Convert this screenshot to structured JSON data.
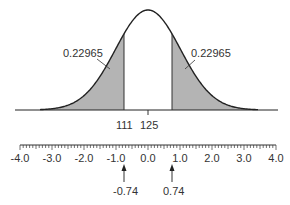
{
  "diagram": {
    "type": "normal-distribution",
    "tail_areas": {
      "left": "0.22965",
      "right": "0.22965"
    },
    "raw_scores": {
      "lower": "111",
      "mean": "125"
    },
    "z_axis": {
      "tick_labels": [
        "-4.0",
        "-3.0",
        "-2.0",
        "-1.0",
        "0.0",
        "1.0",
        "2.0",
        "3.0",
        "4.0"
      ],
      "min": -4.0,
      "max": 4.0,
      "minor_step": 0.1
    },
    "z_markers": {
      "left": "-0.74",
      "right": "0.74"
    },
    "colors": {
      "shade": "#b4b4b4",
      "line": "#222222",
      "text": "#333333"
    }
  }
}
